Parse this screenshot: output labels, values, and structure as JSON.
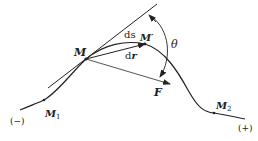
{
  "figure": {
    "labels": {
      "M": "M",
      "M_prime": "M′",
      "M1": "M",
      "M1_sub": "1",
      "M2": "M",
      "M2_sub": "2",
      "ds": "ds",
      "d_prefix": "d",
      "r": "r",
      "F": "F",
      "theta": "θ",
      "neg": "(−)",
      "pos": "(+)"
    },
    "points": {
      "M": [
        86,
        59
      ],
      "M_prime": [
        145,
        44
      ],
      "M1": [
        44,
        100
      ],
      "M2": [
        214,
        113
      ]
    },
    "colors": {
      "curve": "#222222",
      "force": "#555555",
      "background": "#ffffff"
    }
  }
}
